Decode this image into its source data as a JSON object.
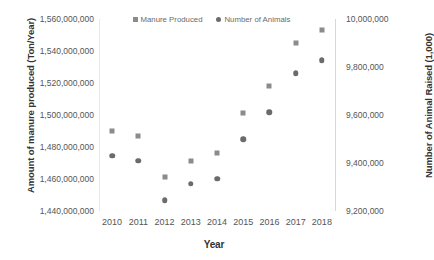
{
  "chart_data": {
    "type": "scatter",
    "title": "",
    "xlabel": "Year",
    "ylabel": "Amount of manure produced (Ton/Year)",
    "y2label": "Number of Animal Raised (1,000)",
    "grid": false,
    "legend_position": "top-center",
    "categories": [
      "2010",
      "2011",
      "2012",
      "2013",
      "2014",
      "2015",
      "2016",
      "2017",
      "2018"
    ],
    "x": [
      2010,
      2011,
      2012,
      2013,
      2014,
      2015,
      2016,
      2017,
      2018
    ],
    "xlim": [
      2009.5,
      2018.5
    ],
    "ylim": [
      1440000000,
      1560000000
    ],
    "y2lim": [
      9200000,
      10000000
    ],
    "y_ticks": [
      "1,440,000,000",
      "1,460,000,000",
      "1,480,000,000",
      "1,500,000,000",
      "1,520,000,000",
      "1,540,000,000",
      "1,560,000,000"
    ],
    "y_tick_values": [
      1440000000,
      1460000000,
      1480000000,
      1500000000,
      1520000000,
      1540000000,
      1560000000
    ],
    "y2_ticks": [
      "9,200,000",
      "9,400,000",
      "9,600,000",
      "9,800,000",
      "10,000,000"
    ],
    "y2_tick_values": [
      9200000,
      9400000,
      9600000,
      9800000,
      10000000
    ],
    "series": [
      {
        "name": "Manure Produced",
        "axis": "left",
        "marker": "square",
        "color": "#8b8b8b",
        "values": [
          1490000000,
          1487000000,
          1461000000,
          1471000000,
          1476000000,
          1501000000,
          1518000000,
          1545000000,
          1553000000
        ]
      },
      {
        "name": "Number of Animals",
        "axis": "right",
        "marker": "circle",
        "color": "#6b6b6b",
        "values": [
          9431000,
          9409000,
          9244000,
          9313000,
          9334000,
          9498000,
          9612000,
          9774000,
          9829000
        ]
      }
    ]
  },
  "legend": {
    "entries": [
      {
        "label": "Manure Produced",
        "marker": "square",
        "color": "#8b8b8b"
      },
      {
        "label": "Number of Animals",
        "marker": "circle",
        "color": "#6b6b6b"
      }
    ]
  },
  "axes": {
    "x_title": "Year",
    "y_left_title": "Amount of manure produced (Ton/Year)",
    "y_right_title": "Number of Animal Raised (1,000)"
  },
  "colors": {
    "series_manure": "#8b8b8b",
    "series_animals": "#6b6b6b",
    "axis_line": "#d8d8d8",
    "tick_text": "#555555",
    "title_text": "#333333",
    "background": "#ffffff"
  }
}
